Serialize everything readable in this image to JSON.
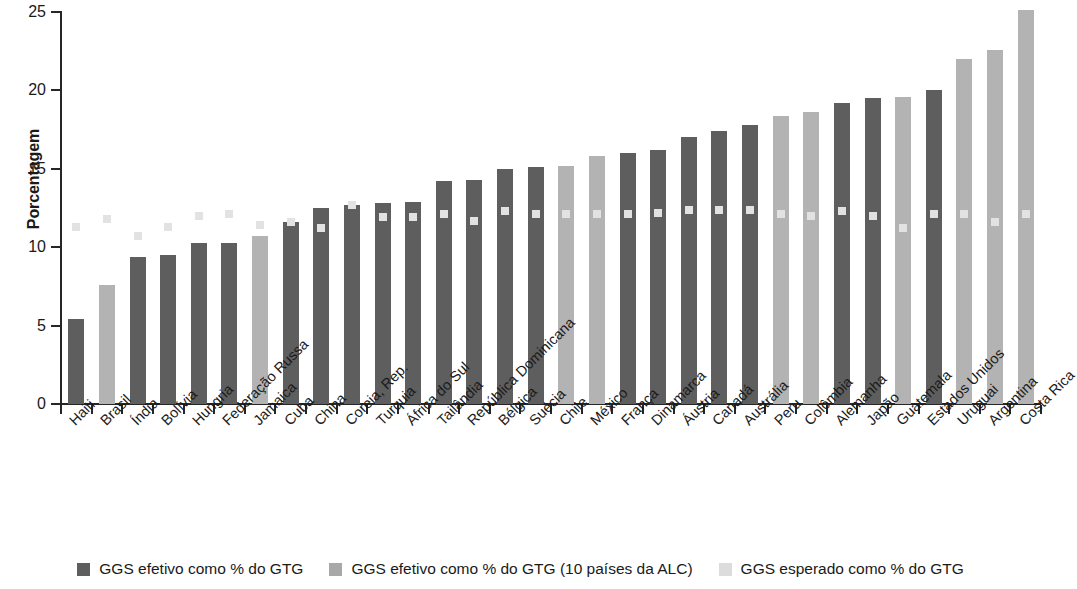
{
  "chart_data": {
    "type": "bar",
    "title": "",
    "xlabel": "",
    "ylabel": "Porcentagem",
    "ylim": [
      0,
      25
    ],
    "yticks": [
      0,
      5,
      10,
      15,
      20,
      25
    ],
    "grid": false,
    "legend_position": "bottom",
    "categories": [
      "Haiti",
      "Brasil",
      "Índia",
      "Bolívia",
      "Hungria",
      "Federação Russa",
      "Jamaica",
      "Cuba",
      "China",
      "Coreia, Rep.",
      "Turquia",
      "África do Sul",
      "Tailândia",
      "República Dominicana",
      "Bélgica",
      "Suécia",
      "Chile",
      "México",
      "França",
      "Dinamarca",
      "Áustria",
      "Canadá",
      "Austrália",
      "Peru",
      "Colômbia",
      "Alemanha",
      "Japão",
      "Guatemala",
      "Estados Unidos",
      "Uruguai",
      "Argentina",
      "Costa Rica"
    ],
    "series": [
      {
        "name": "GGS efetivo como % do GTG",
        "key": "effective",
        "color": "#5e5e5e",
        "values": [
          5.4,
          null,
          9.4,
          9.5,
          10.3,
          10.3,
          null,
          11.6,
          12.5,
          12.7,
          12.8,
          12.9,
          14.2,
          14.3,
          15.0,
          15.1,
          null,
          null,
          16.0,
          16.2,
          17.0,
          17.4,
          17.8,
          null,
          null,
          19.2,
          19.5,
          null,
          20.0,
          null,
          null,
          null
        ]
      },
      {
        "name": "GGS efetivo como % do GTG (10 países da ALC)",
        "key": "alc",
        "color": "#b3b3b3",
        "values": [
          null,
          7.6,
          null,
          null,
          null,
          null,
          10.7,
          null,
          null,
          null,
          null,
          null,
          null,
          null,
          null,
          null,
          15.2,
          15.8,
          null,
          null,
          null,
          null,
          null,
          18.4,
          18.6,
          null,
          null,
          19.6,
          null,
          22.0,
          22.6,
          25.1
        ]
      },
      {
        "name": "GGS esperado como % do GTG",
        "key": "expected",
        "color": "#dcdcdc",
        "marker": "square",
        "values": [
          11.3,
          11.8,
          10.7,
          11.3,
          12.0,
          12.1,
          11.4,
          11.6,
          11.2,
          12.7,
          11.9,
          11.9,
          12.1,
          11.7,
          12.3,
          12.1,
          12.1,
          12.1,
          12.1,
          12.2,
          12.4,
          12.4,
          12.4,
          12.1,
          12.0,
          12.3,
          12.0,
          11.2,
          12.1,
          12.1,
          11.6,
          12.1
        ]
      }
    ]
  },
  "legend": {
    "items": [
      {
        "label": "GGS efetivo como % do GTG",
        "swatch": "sw-effective",
        "name": "legend-effective"
      },
      {
        "label": "GGS efetivo como % do GTG (10 países da ALC)",
        "swatch": "sw-alc",
        "name": "legend-alc"
      },
      {
        "label": "GGS esperado como % do GTG",
        "swatch": "sw-expected",
        "name": "legend-expected"
      }
    ]
  },
  "colors": {
    "effective": "#5e5e5e",
    "alc": "#b3b3b3",
    "expected": "#dcdcdc",
    "axis": "#262626",
    "text": "#1a1a1a",
    "background": "#ffffff"
  }
}
